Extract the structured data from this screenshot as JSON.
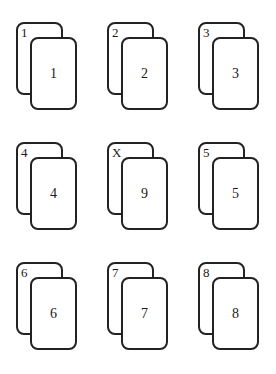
{
  "diagram": {
    "pairs": [
      {
        "back_label": "1",
        "front_label": "1"
      },
      {
        "back_label": "2",
        "front_label": "2"
      },
      {
        "back_label": "3",
        "front_label": "3"
      },
      {
        "back_label": "4",
        "front_label": "4"
      },
      {
        "back_label": "X",
        "front_label": "9"
      },
      {
        "back_label": "5",
        "front_label": "5"
      },
      {
        "back_label": "6",
        "front_label": "6"
      },
      {
        "back_label": "7",
        "front_label": "7"
      },
      {
        "back_label": "8",
        "front_label": "8"
      }
    ],
    "colors": {
      "stroke": "#222222",
      "card_fill": "#ffffff",
      "background": "#ffffff"
    }
  }
}
